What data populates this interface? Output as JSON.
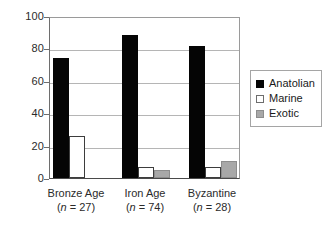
{
  "chart_data": {
    "type": "bar",
    "title": "",
    "xlabel": "",
    "ylabel": "",
    "ylim": [
      0,
      100
    ],
    "yticks": [
      0,
      20,
      40,
      60,
      80,
      100
    ],
    "grid": true,
    "legend_position": "right",
    "categories": [
      "Bronze Age",
      "Iron Age",
      "Byzantine"
    ],
    "category_sublabels": [
      "(n = 27)",
      "(n = 74)",
      "(n = 28)"
    ],
    "category_n": [
      27,
      74,
      28
    ],
    "series": [
      {
        "name": "Anatolian",
        "color": "#050505",
        "values": [
          74,
          88,
          81.5
        ]
      },
      {
        "name": "Marine",
        "color": "#ffffff",
        "values": [
          26,
          7,
          7
        ]
      },
      {
        "name": "Exotic",
        "color": "#a8a8a8",
        "values": [
          0,
          5,
          10.5
        ]
      }
    ]
  },
  "axis": {
    "ytick_labels": [
      "100",
      "80",
      "60",
      "40",
      "20",
      "0"
    ]
  },
  "legend": {
    "items": [
      {
        "label": "Anatolian",
        "swatch": "black-square-icon"
      },
      {
        "label": "Marine",
        "swatch": "white-square-icon"
      },
      {
        "label": "Exotic",
        "swatch": "gray-square-icon"
      }
    ]
  },
  "xaxis": {
    "groups": [
      {
        "category": "Bronze Age",
        "n_prefix": "(",
        "n_symbol": "n",
        "n_suffix": " = 27)"
      },
      {
        "category": "Iron Age",
        "n_prefix": "(",
        "n_symbol": "n",
        "n_suffix": " = 74)"
      },
      {
        "category": "Byzantine",
        "n_prefix": "(",
        "n_symbol": "n",
        "n_suffix": " = 28)"
      }
    ]
  }
}
